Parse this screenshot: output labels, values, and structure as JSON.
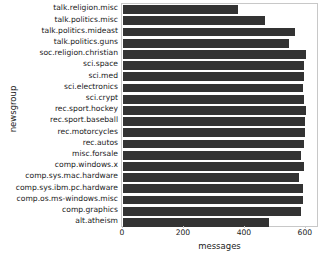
{
  "chart_data": {
    "type": "bar",
    "orientation": "horizontal",
    "title": "",
    "xlabel": "messages",
    "ylabel": "newsgroup",
    "xlim": [
      0,
      640
    ],
    "xticks": [
      0,
      200,
      400,
      600
    ],
    "xticklabels": [
      "0",
      "200",
      "400",
      "600"
    ],
    "grid": false,
    "legend": null,
    "bar_color": "#333333",
    "frame_color": "#c8c8c8",
    "categories": [
      "talk.religion.misc",
      "talk.politics.misc",
      "talk.politics.mideast",
      "talk.politics.guns",
      "soc.religion.christian",
      "sci.space",
      "sci.med",
      "sci.electronics",
      "sci.crypt",
      "rec.sport.hockey",
      "rec.sport.baseball",
      "rec.motorcycles",
      "rec.autos",
      "misc.forsale",
      "comp.windows.x",
      "comp.sys.mac.hardware",
      "comp.sys.ibm.pc.hardware",
      "comp.os.ms-windows.misc",
      "comp.graphics",
      "alt.atheism"
    ],
    "values": [
      377,
      465,
      564,
      546,
      599,
      593,
      594,
      591,
      595,
      600,
      597,
      598,
      594,
      585,
      593,
      578,
      590,
      591,
      584,
      480
    ]
  },
  "axes": {
    "ylabel_text": "newsgroup",
    "xlabel_text": "messages"
  }
}
